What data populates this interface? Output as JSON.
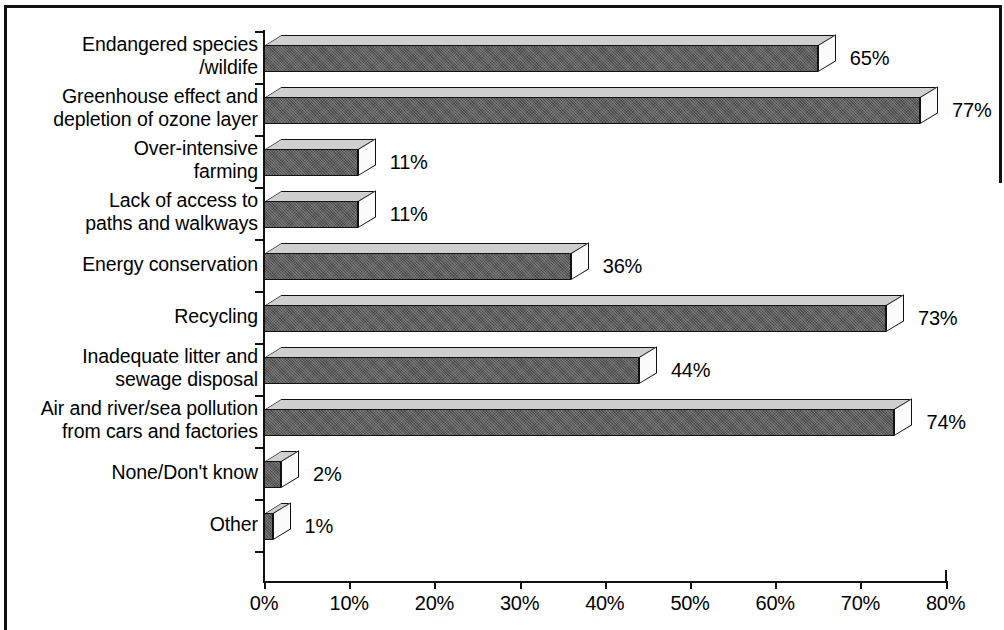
{
  "chart_data": {
    "type": "bar",
    "orientation": "horizontal",
    "title": "",
    "xlabel": "",
    "ylabel": "",
    "xlim": [
      0,
      80
    ],
    "xticks": [
      "0%",
      "10%",
      "20%",
      "30%",
      "40%",
      "50%",
      "60%",
      "70%",
      "80%"
    ],
    "xtick_values": [
      0,
      10,
      20,
      30,
      40,
      50,
      60,
      70,
      80
    ],
    "grid": false,
    "legend": null,
    "style_3d": true,
    "categories": [
      "Endangered species\n/wildife",
      "Greenhouse effect and\ndepletion of ozone layer",
      "Over-intensive\nfarming",
      "Lack of access to\npaths and walkways",
      "Energy conservation",
      "Recycling",
      "Inadequate litter and\nsewage disposal",
      "Air and river/sea pollution\nfrom cars and factories",
      "None/Don't know",
      "Other"
    ],
    "values": [
      65,
      77,
      11,
      11,
      36,
      73,
      44,
      74,
      2,
      1
    ],
    "value_labels": [
      "65%",
      "77%",
      "11%",
      "11%",
      "36%",
      "73%",
      "44%",
      "74%",
      "2%",
      "1%"
    ],
    "colors": {
      "bar_front": "#5d5d5d",
      "bar_top": "#cfcfcf",
      "bar_side": "#fbfbfb",
      "outline": "#111111",
      "background": "#ffffff"
    }
  }
}
